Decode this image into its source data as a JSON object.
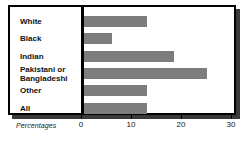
{
  "chart_data": {
    "type": "bar",
    "orientation": "horizontal",
    "title": "",
    "subtitle": "",
    "xlabel": "Percentages",
    "ylabel": "",
    "categories": [
      "White",
      "Black",
      "Indian",
      "Pakistani or Bangladeshi",
      "Other",
      "All"
    ],
    "values": [
      12.5,
      5.5,
      18,
      24.5,
      12.5,
      12.5
    ],
    "xlim": [
      0,
      30
    ],
    "xticks": [
      0,
      10,
      20,
      30
    ],
    "xtick_labels": [
      "0",
      "10",
      "20",
      "30"
    ],
    "grid": false,
    "legend": false,
    "bar_color": "#7d7d7d",
    "frame_color": "#000000",
    "background_color": "#ffffff"
  },
  "chart": {
    "axis_caption": "Percentages",
    "rows": [
      {
        "label": "White",
        "value": 12.5,
        "label_line1": "White",
        "label_line2": ""
      },
      {
        "label": "Black",
        "value": 5.5,
        "label_line1": "Black",
        "label_line2": ""
      },
      {
        "label": "Indian",
        "value": 18,
        "label_line1": "Indian",
        "label_line2": ""
      },
      {
        "label": "Pakistani or Bangladeshi",
        "value": 24.5,
        "label_line1": "Pakistani or",
        "label_line2": "Bangladeshi"
      },
      {
        "label": "Other",
        "value": 12.5,
        "label_line1": "Other",
        "label_line2": ""
      },
      {
        "label": "All",
        "value": 12.5,
        "label_line1": "All",
        "label_line2": ""
      }
    ],
    "ticks": [
      {
        "label": "0",
        "value": 0
      },
      {
        "label": "10",
        "value": 10
      },
      {
        "label": "20",
        "value": 20
      },
      {
        "label": "30",
        "value": 30
      }
    ]
  }
}
